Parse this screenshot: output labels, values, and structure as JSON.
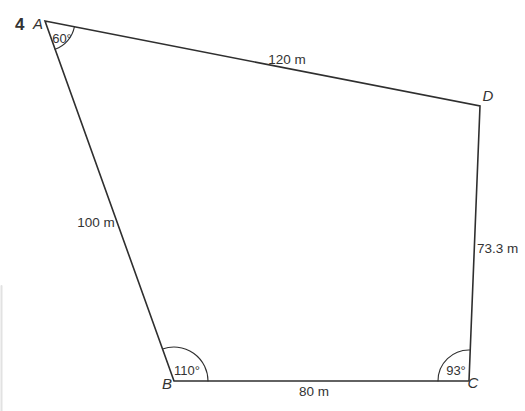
{
  "figure": {
    "problem_number": "4",
    "vertex_labels": {
      "A": "A",
      "B": "B",
      "C": "C",
      "D": "D"
    },
    "angle_labels": {
      "A": "60°",
      "B": "110°",
      "C": "93°"
    },
    "side_labels": {
      "AD": "120 m",
      "AB": "100 m",
      "BC": "80 m",
      "CD": "73.3 m"
    }
  },
  "colors": {
    "line": "#2f2f2f",
    "text": "#333333",
    "page_edge": "#e2e2e2"
  }
}
